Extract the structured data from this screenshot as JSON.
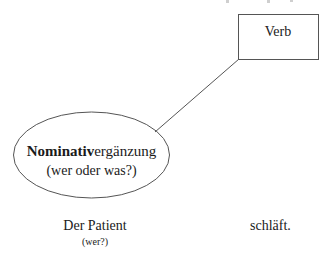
{
  "diagram": {
    "verb_box": {
      "label": "Verb"
    },
    "complement": {
      "bold_part": "Nominativ",
      "rest": "ergänzung",
      "question": "(wer oder was?)"
    },
    "sentence": {
      "subject": "Der Patient",
      "subject_question": "(wer?)",
      "verb": "schläft."
    },
    "colors": {
      "stroke": "#555555",
      "text": "#1a1a1a",
      "background": "#ffffff"
    }
  }
}
